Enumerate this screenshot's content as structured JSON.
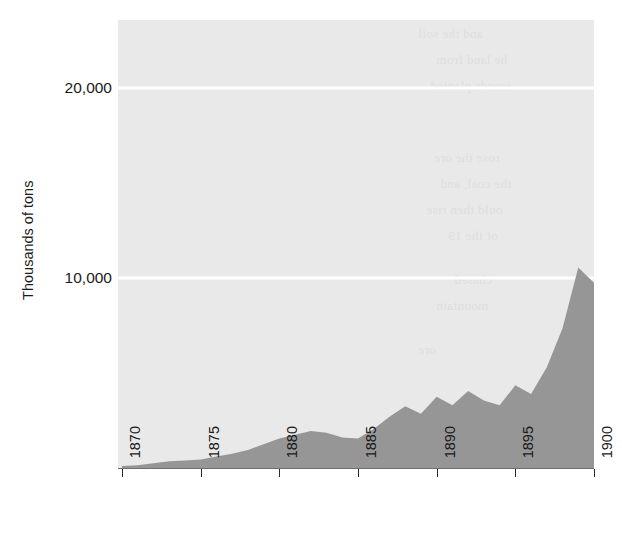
{
  "chart_data": {
    "type": "area",
    "title": "",
    "subtitle": "",
    "xlabel": "",
    "ylabel": "Thousands of tons",
    "xlim": [
      1870,
      1900
    ],
    "ylim": [
      0,
      23579
    ],
    "grid": true,
    "legend": null,
    "y_ticks": [
      {
        "value": 10000,
        "label": "10,000"
      },
      {
        "value": 20000,
        "label": "20,000"
      }
    ],
    "x_ticks": [
      {
        "value": 1870,
        "label": "1870"
      },
      {
        "value": 1875,
        "label": "1875"
      },
      {
        "value": 1880,
        "label": "1880"
      },
      {
        "value": 1885,
        "label": "1885"
      },
      {
        "value": 1890,
        "label": "1890"
      },
      {
        "value": 1895,
        "label": "1895"
      },
      {
        "value": 1900,
        "label": "1900"
      }
    ],
    "x": [
      1870,
      1871,
      1872,
      1873,
      1874,
      1875,
      1876,
      1877,
      1878,
      1879,
      1880,
      1881,
      1882,
      1883,
      1884,
      1885,
      1886,
      1887,
      1888,
      1889,
      1890,
      1891,
      1892,
      1893,
      1894,
      1895,
      1896,
      1897,
      1898,
      1899,
      1900
    ],
    "values": [
      100,
      150,
      250,
      350,
      400,
      450,
      600,
      750,
      950,
      1250,
      1550,
      1750,
      1950,
      1850,
      1600,
      1550,
      2050,
      2700,
      3250,
      2850,
      3750,
      3300,
      4050,
      3550,
      3300,
      4350,
      3900,
      5300,
      7350,
      10550,
      9750
    ],
    "series": [
      {
        "name": "Output",
        "fill_color": "#969696",
        "values": [
          100,
          150,
          250,
          350,
          400,
          450,
          600,
          750,
          950,
          1250,
          1550,
          1750,
          1950,
          1850,
          1600,
          1550,
          2050,
          2700,
          3250,
          2850,
          3750,
          3300,
          4050,
          3550,
          3300,
          4350,
          3900,
          5300,
          7350,
          10550,
          9750
        ]
      }
    ],
    "colors": {
      "plot_background": "#e9e9e9",
      "area_fill": "#969696",
      "gridline": "#ffffff",
      "axis": "#6f6f6f",
      "text": "#1a1a1a"
    },
    "bleed_text": [
      "and the soil",
      "he land from",
      "woods planted",
      "rose the ore",
      "the coal, and",
      "ould then rise",
      "of the 19",
      "chased",
      "mountain",
      "ore"
    ]
  }
}
